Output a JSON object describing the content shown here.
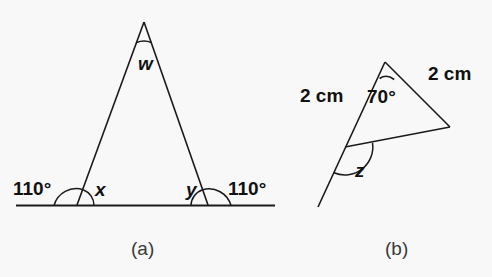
{
  "figure": {
    "background_color": "#f8f8f8",
    "stroke_color": "#1a1a1a",
    "text_color": "#111111"
  },
  "panel_a": {
    "caption": "(a)",
    "description": "Isosceles triangle standing on a horizontal straight line, with exterior angles marked on both sides of the base.",
    "apex_angle_label": "w",
    "base_left_interior_label": "x",
    "base_right_interior_label": "y",
    "exterior_left_label": "110°",
    "exterior_right_label": "110°"
  },
  "panel_b": {
    "caption": "(b)",
    "description": "Triangle with two equal sides of 2 cm, an apex angle of 70 degrees, and one side extended beyond the lower-left vertex creating exterior angle z.",
    "apex_angle_label": "70°",
    "side_left_label": "2 cm",
    "side_right_label": "2 cm",
    "exterior_angle_label": "z"
  }
}
